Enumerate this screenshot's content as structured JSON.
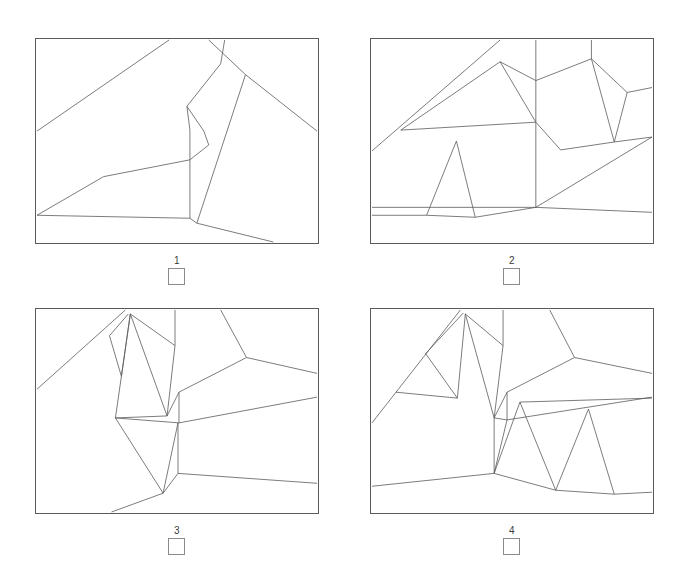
{
  "page": {
    "background_color": "#ffffff",
    "line_color": "#5a5a5a",
    "text_color": "#3a3a3a",
    "width": 683,
    "height": 563,
    "layout": "2x2 grid of framed line drawings, each with a number label and an empty checkbox below"
  },
  "panels": [
    {
      "id": "panel-1",
      "label": "1",
      "checkbox_checked": false,
      "frame": {
        "x": 35,
        "y": 38,
        "width": 284,
        "height": 206
      },
      "viewbox": "0 0 284 206",
      "strokes": [
        "M 1 93 L 134 1",
        "M 68 139 L 1 178",
        "M 68 139 L 155 122",
        "M 155 122 L 155 92",
        "M 155 92 L 152 68",
        "M 152 68 L 186 25",
        "M 186 25 L 190 1",
        "M 152 68 L 169 93",
        "M 169 93 L 174 107",
        "M 174 107 L 155 122",
        "M 155 122 L 155 181",
        "M 155 181 L 1 178",
        "M 155 181 L 162 186",
        "M 162 186 L 211 36",
        "M 211 36 L 283 93",
        "M 211 36 L 174 1",
        "M 162 186 L 239 205",
        "M 134 1 L 134 1"
      ]
    },
    {
      "id": "panel-2",
      "label": "2",
      "checkbox_checked": false,
      "frame": {
        "x": 370,
        "y": 38,
        "width": 284,
        "height": 206
      },
      "viewbox": "0 0 284 206",
      "strokes": [
        "M 1 113 L 130 1",
        "M 30 92 L 130 23",
        "M 130 23 L 166 42",
        "M 166 42 L 166 1",
        "M 166 42 L 222 20",
        "M 222 20 L 222 1",
        "M 222 20 L 258 54",
        "M 258 54 L 283 49",
        "M 222 20 L 245 104",
        "M 245 104 L 258 54",
        "M 245 104 L 283 99",
        "M 130 23 L 166 84",
        "M 166 84 L 166 42",
        "M 166 84 L 191 112",
        "M 191 112 L 245 104",
        "M 30 92 L 166 84",
        "M 166 84 L 166 170",
        "M 166 170 L 283 99",
        "M 166 170 L 1 170",
        "M 86 103 L 56 178",
        "M 86 103 L 105 180",
        "M 1 178 L 56 178",
        "M 56 178 L 105 180",
        "M 105 180 L 166 170",
        "M 166 170 L 283 175"
      ]
    },
    {
      "id": "panel-3",
      "label": "3",
      "checkbox_checked": false,
      "frame": {
        "x": 35,
        "y": 326,
        "width": 284,
        "height": 206
      },
      "viewbox": "0 0 284 206",
      "strokes": [
        "M 1 81 L 90 1",
        "M 74 27 L 93 5",
        "M 74 27 L 86 68",
        "M 86 68 L 95 5",
        "M 95 5 L 140 37",
        "M 140 37 L 140 1",
        "M 140 37 L 132 108",
        "M 132 108 L 95 5",
        "M 95 5 L 80 110",
        "M 80 110 L 132 108",
        "M 132 108 L 144 84",
        "M 144 84 L 212 49",
        "M 212 49 L 186 1",
        "M 212 49 L 283 65",
        "M 144 84 L 144 115",
        "M 144 115 L 283 89",
        "M 144 115 L 80 110",
        "M 80 110 L 128 186",
        "M 128 186 L 143 115",
        "M 143 115 L 143 166",
        "M 143 166 L 283 176",
        "M 143 166 L 128 186",
        "M 128 186 L 76 205"
      ]
    },
    {
      "id": "panel-4",
      "label": "4",
      "checkbox_checked": false,
      "frame": {
        "x": 370,
        "y": 326,
        "width": 284,
        "height": 206
      },
      "viewbox": "0 0 284 206",
      "strokes": [
        "M 1 115 L 90 1",
        "M 55 45 L 93 4",
        "M 55 45 L 87 90",
        "M 87 90 L 95 5",
        "M 95 5 L 133 37",
        "M 133 37 L 133 1",
        "M 133 37 L 124 110",
        "M 124 110 L 95 5",
        "M 25 84 L 87 90",
        "M 124 110 L 137 84",
        "M 137 84 L 205 49",
        "M 205 49 L 180 1",
        "M 205 49 L 283 65",
        "M 137 84 L 137 112",
        "M 137 112 L 283 89",
        "M 137 112 L 124 110",
        "M 124 110 L 124 166",
        "M 124 166 L 1 179",
        "M 124 166 L 137 112",
        "M 124 166 L 150 94",
        "M 150 94 L 283 90",
        "M 150 94 L 186 183",
        "M 186 183 L 124 166",
        "M 186 183 L 219 101",
        "M 219 101 L 245 187",
        "M 245 187 L 186 183",
        "M 245 187 L 283 185"
      ]
    }
  ],
  "icons": {
    "checkbox": "empty-square-checkbox"
  }
}
